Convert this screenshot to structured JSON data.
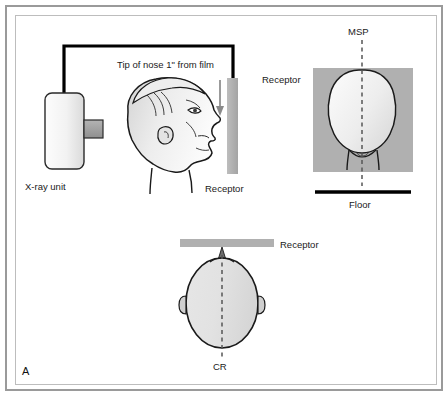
{
  "figure": {
    "panel_letter": "A",
    "background_color": "#ffffff",
    "frame_color": "#9a9a9a"
  },
  "palette": {
    "receptor_gray": "#b0b0b0",
    "head_fill_light": "#f7f7f7",
    "head_fill_dark": "#dcdcdc",
    "outline": "#1a1a1a",
    "cone_gray": "#9e9e9e",
    "tube_black": "#000000",
    "dashed_line": "#555555"
  },
  "panels": {
    "lateral": {
      "name": "lateral-projection-panel",
      "labels": {
        "xray_unit": "X-ray unit",
        "nose_note": "Tip of nose 1\" from film",
        "receptor": "Receptor"
      }
    },
    "posterior": {
      "name": "posterior-projection-panel",
      "labels": {
        "msp": "MSP",
        "receptor": "Receptor",
        "floor": "Floor"
      }
    },
    "superior": {
      "name": "superior-projection-panel",
      "labels": {
        "receptor": "Receptor",
        "cr": "CR"
      }
    }
  }
}
